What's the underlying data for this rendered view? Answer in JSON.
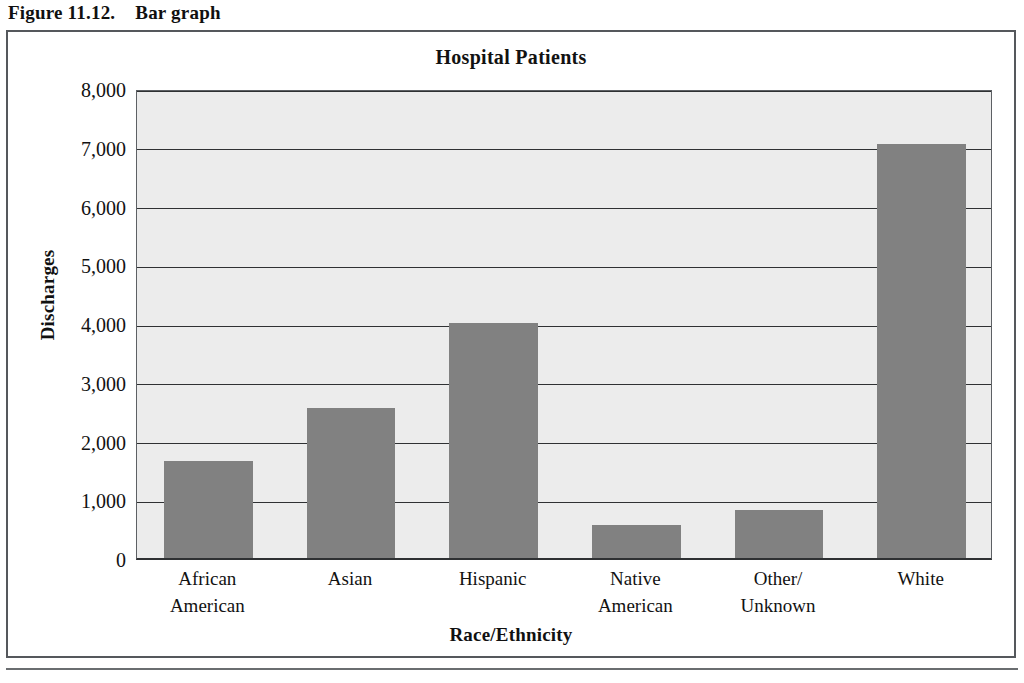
{
  "figure": {
    "number": "Figure 11.12.",
    "caption": "Bar graph"
  },
  "chart_data": {
    "type": "bar",
    "title": "Hospital Patients",
    "xlabel": "Race/Ethnicity",
    "ylabel": "Discharges",
    "categories": [
      "African American",
      "Asian",
      "Hispanic",
      "Native American",
      "Other/Unknown",
      "White"
    ],
    "category_lines": [
      [
        "African",
        "American"
      ],
      [
        "Asian",
        ""
      ],
      [
        "Hispanic",
        ""
      ],
      [
        "Native",
        "American"
      ],
      [
        "Other/",
        "Unknown"
      ],
      [
        "White",
        ""
      ]
    ],
    "values": [
      1650,
      2550,
      4000,
      560,
      820,
      7050
    ],
    "ylim": [
      0,
      8000
    ],
    "ytick_values": [
      0,
      1000,
      2000,
      3000,
      4000,
      5000,
      6000,
      7000,
      8000
    ],
    "ytick_labels": [
      "0",
      "1,000",
      "2,000",
      "3,000",
      "4,000",
      "5,000",
      "6,000",
      "7,000",
      "8,000"
    ],
    "grid": true,
    "legend": false,
    "bar_color": "#818181",
    "plot_background": "#ececec",
    "axis_color": "#2f3133"
  }
}
